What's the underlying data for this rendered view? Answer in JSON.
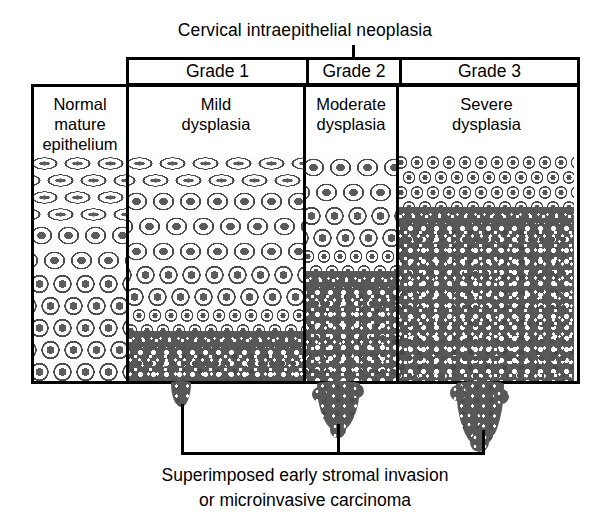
{
  "title": "Cervical intraepithelial neoplasia",
  "grade_headers": [
    {
      "label": "Grade 1"
    },
    {
      "label": "Grade 2"
    },
    {
      "label": "Grade 3"
    }
  ],
  "columns": [
    {
      "name": "normal",
      "label_lines": [
        "Normal",
        "mature",
        "epithelium"
      ]
    },
    {
      "name": "grade-1",
      "label_lines": [
        "Mild",
        "dysplasia"
      ]
    },
    {
      "name": "grade-2",
      "label_lines": [
        "Moderate",
        "dysplasia"
      ]
    },
    {
      "name": "grade-3",
      "label_lines": [
        "Severe",
        "dysplasia"
      ]
    }
  ],
  "caption_lines": [
    "Superimposed early stromal invasion",
    "or microinvasive carcinoma"
  ],
  "colors": {
    "ink": "#000000",
    "background": "#ffffff",
    "dysplastic_mass": "#585858",
    "nucleus": "#5a5a5a",
    "cell_outline": "#4a4a4a"
  }
}
